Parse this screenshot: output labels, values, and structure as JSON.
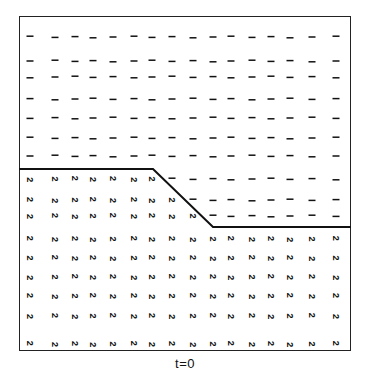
{
  "figure": {
    "caption": "t=0",
    "frame": {
      "left": 19,
      "top": 16,
      "right": 351,
      "bottom": 351
    },
    "symbols": {
      "phase_1": "-",
      "phase_2": "2"
    },
    "colors": {
      "ink": "#111111",
      "background": "#ffffff"
    },
    "interface_line": [
      [
        19,
        169
      ],
      [
        153,
        169
      ],
      [
        213,
        227
      ],
      [
        351,
        227
      ]
    ],
    "columns_x": [
      30,
      55,
      75,
      93,
      113,
      134,
      152,
      172,
      193,
      213,
      231,
      252,
      271,
      290,
      312,
      336
    ],
    "rows": [
      {
        "y": 37,
        "count_2": 0
      },
      {
        "y": 61,
        "count_2": 0
      },
      {
        "y": 77,
        "count_2": 0
      },
      {
        "y": 99,
        "count_2": 0
      },
      {
        "y": 118,
        "count_2": 0
      },
      {
        "y": 138,
        "count_2": 0
      },
      {
        "y": 156,
        "count_2": 0
      },
      {
        "y": 179,
        "count_2": 7
      },
      {
        "y": 200,
        "count_2": 8
      },
      {
        "y": 216,
        "count_2": 9
      },
      {
        "y": 239,
        "count_2": 16
      },
      {
        "y": 258,
        "count_2": 16
      },
      {
        "y": 277,
        "count_2": 16
      },
      {
        "y": 296,
        "count_2": 16
      },
      {
        "y": 316,
        "count_2": 16
      },
      {
        "y": 344,
        "count_2": 16
      }
    ]
  }
}
